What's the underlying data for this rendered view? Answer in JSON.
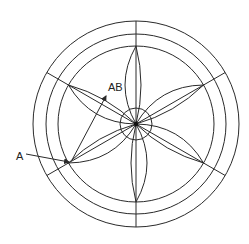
{
  "diagram": {
    "center": {
      "x": 136,
      "y": 124
    },
    "rings": [
      {
        "name": "outer-ring",
        "r": 103
      },
      {
        "name": "middle-ring",
        "r": 90
      },
      {
        "name": "inner-ring",
        "r": 78
      },
      {
        "name": "hub-circle",
        "r": 16
      }
    ],
    "spoke_angles_deg": [
      90,
      30,
      -30,
      -90,
      -150,
      150
    ],
    "blade_count": 6,
    "labels": {
      "A": "A",
      "AB": "AB"
    },
    "stroke_color": "#2a2a2a",
    "background": "#ffffff"
  }
}
